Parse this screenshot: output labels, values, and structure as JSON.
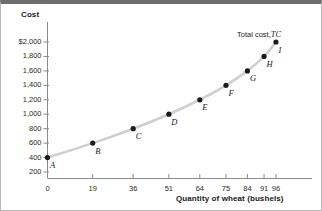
{
  "chart_data": {
    "type": "line",
    "title": "",
    "xlabel": "Quantity of wheat (bushels)",
    "ylabel": "Cost",
    "series_label": "Total cost,",
    "series_symbol": "TC",
    "x": [
      0,
      19,
      36,
      51,
      64,
      75,
      84,
      91,
      96
    ],
    "values": [
      400,
      600,
      800,
      1000,
      1200,
      1400,
      1600,
      1800,
      2000
    ],
    "point_labels": [
      "A",
      "B",
      "C",
      "D",
      "E",
      "F",
      "G",
      "H",
      "I"
    ],
    "xticks": [
      "0",
      "19",
      "36",
      "51",
      "64",
      "75",
      "84",
      "91",
      "96"
    ],
    "yticks": [
      "$2,000",
      "1,800",
      "1,600",
      "1,400",
      "1,200",
      "1,000",
      "800",
      "600",
      "400",
      "200"
    ],
    "ytick_values": [
      2000,
      1800,
      1600,
      1400,
      1200,
      1000,
      800,
      600,
      400,
      200
    ],
    "xlim": [
      0,
      104
    ],
    "ylim": [
      0,
      2100
    ],
    "grid": false,
    "legend": "none",
    "curve_color": "#cfcfcf",
    "point_color": "#1a1a1a",
    "axis_color": "#8a8a8a",
    "text_color": "#1a1a1a"
  }
}
